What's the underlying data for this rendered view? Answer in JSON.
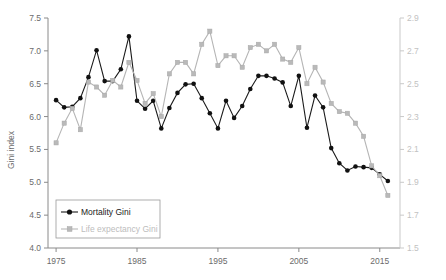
{
  "chart_data": {
    "type": "line",
    "title": "",
    "xlabel": "",
    "ylabel": "Gini index",
    "y2label": "",
    "xlim": [
      1974,
      2017.5
    ],
    "ylim": [
      4.0,
      7.5
    ],
    "y2lim": [
      1.5,
      2.9
    ],
    "xticks": [
      1975,
      1985,
      1995,
      2005,
      2015
    ],
    "xticklabels": [
      "1975",
      "1985",
      "1995",
      "2005",
      "2015"
    ],
    "yticks": [
      4.0,
      4.5,
      5.0,
      5.5,
      6.0,
      6.5,
      7.0,
      7.5
    ],
    "yticklabels": [
      "4.0",
      "4.5",
      "5.0",
      "5.5",
      "6.0",
      "6.5",
      "7.0",
      "7.5"
    ],
    "y2ticks": [
      1.5,
      1.7,
      1.9,
      2.1,
      2.3,
      2.5,
      2.7,
      2.9
    ],
    "y2ticklabels": [
      "1.5",
      "1.7",
      "1.9",
      "2.1",
      "2.3",
      "2.5",
      "2.7",
      "2.9"
    ],
    "grid": false,
    "legend_position": "lower left",
    "x": [
      1975,
      1976,
      1977,
      1978,
      1979,
      1980,
      1981,
      1982,
      1983,
      1984,
      1985,
      1986,
      1987,
      1988,
      1989,
      1990,
      1991,
      1992,
      1993,
      1994,
      1995,
      1996,
      1997,
      1998,
      1999,
      2000,
      2001,
      2002,
      2003,
      2004,
      2005,
      2006,
      2007,
      2008,
      2009,
      2010,
      2011,
      2012,
      2013,
      2014,
      2015,
      2016
    ],
    "series": [
      {
        "name": "Mortality Gini",
        "axis": "left",
        "color": "#111111",
        "marker": "filled-circle",
        "values": [
          6.25,
          6.14,
          6.15,
          6.28,
          6.6,
          7.01,
          6.54,
          6.54,
          6.72,
          7.22,
          6.24,
          6.12,
          6.24,
          5.82,
          6.13,
          6.36,
          6.49,
          6.5,
          6.28,
          6.05,
          5.82,
          6.24,
          5.98,
          6.16,
          6.42,
          6.62,
          6.62,
          6.58,
          6.52,
          6.16,
          6.62,
          5.83,
          6.32,
          6.14,
          5.52,
          5.29,
          5.18,
          5.24,
          5.23,
          5.22,
          5.12,
          5.02
        ]
      },
      {
        "name": "Life expectancy Gini",
        "axis": "right",
        "color": "#b9b9b9",
        "marker": "filled-square",
        "values": [
          2.14,
          2.26,
          2.35,
          2.22,
          2.51,
          2.48,
          2.43,
          2.52,
          2.48,
          2.63,
          2.52,
          2.38,
          2.44,
          2.3,
          2.56,
          2.63,
          2.63,
          2.56,
          2.74,
          2.82,
          2.61,
          2.67,
          2.67,
          2.6,
          2.72,
          2.74,
          2.7,
          2.74,
          2.65,
          2.63,
          2.72,
          2.5,
          2.6,
          2.51,
          2.38,
          2.33,
          2.32,
          2.26,
          2.18,
          2.0,
          1.94,
          1.82
        ]
      }
    ],
    "series_left_scale_note": {
      "Life expectancy Gini_in_left_units": [
        5.6,
        5.9,
        6.12,
        5.78,
        6.52,
        6.45,
        6.32,
        6.55,
        6.45,
        6.83,
        6.55,
        6.2,
        6.35,
        6.0,
        6.65,
        6.83,
        6.83,
        6.65,
        7.1,
        7.28,
        6.78,
        6.95,
        6.95,
        6.78,
        7.08,
        7.1,
        7.0,
        7.1,
        6.88,
        6.83,
        7.08,
        6.5,
        6.75,
        6.53,
        6.2,
        6.08,
        6.05,
        5.9,
        5.7,
        5.28,
        5.13,
        4.85
      ]
    }
  },
  "legend": {
    "items": [
      {
        "label": "Mortality Gini"
      },
      {
        "label": "Life expectancy Gini"
      }
    ]
  }
}
